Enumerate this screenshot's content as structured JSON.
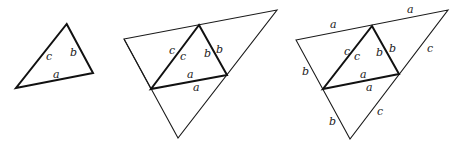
{
  "figures": [
    {
      "name": "single-triangle",
      "labels": {
        "c": "c",
        "b": "b",
        "a": "a"
      }
    },
    {
      "name": "triangle-with-reflections",
      "labels": {
        "c_outer": "c",
        "c_inner": "c",
        "b_inner": "b",
        "b_outer": "b",
        "a_inner": "a",
        "a_outer": "a"
      }
    },
    {
      "name": "full-large-triangle",
      "labels": {
        "a_top_left": "a",
        "a_top_right": "a",
        "b_left_upper": "b",
        "b_left_lower": "b",
        "c_right_upper": "c",
        "c_right_lower": "c",
        "c_inner_outer": "c",
        "c_inner": "c",
        "b_inner": "b",
        "b_inner_outer": "b",
        "a_inner": "a",
        "a_inner_outer": "a"
      }
    }
  ]
}
